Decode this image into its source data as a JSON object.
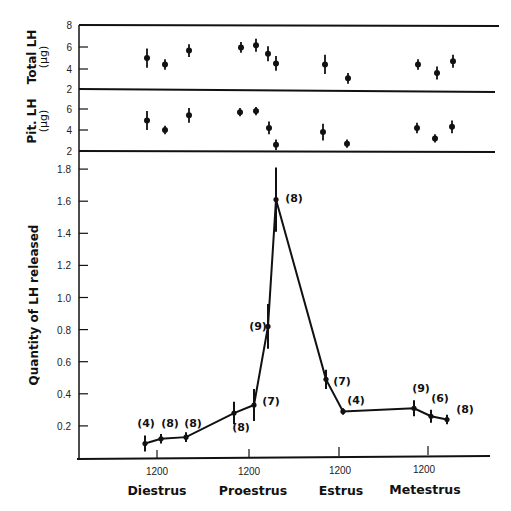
{
  "chart_data": [
    {
      "type": "scatter",
      "panel": "top",
      "ylabel": "Total LH (µg)",
      "ylabel_line1": "Total LH",
      "ylabel_line2": "(µg)",
      "yticks": [
        2,
        4,
        6,
        8
      ],
      "ylim": [
        2,
        8
      ],
      "error_bars": true,
      "points": [
        {
          "x_px": 147,
          "y": 4.9,
          "err": 0.9
        },
        {
          "x_px": 165,
          "y": 4.3,
          "err": 0.5
        },
        {
          "x_px": 189,
          "y": 5.6,
          "err": 0.6
        },
        {
          "x_px": 241,
          "y": 5.9,
          "err": 0.5
        },
        {
          "x_px": 256,
          "y": 6.1,
          "err": 0.6
        },
        {
          "x_px": 268,
          "y": 5.3,
          "err": 0.7
        },
        {
          "x_px": 276,
          "y": 4.4,
          "err": 0.7
        },
        {
          "x_px": 325,
          "y": 4.3,
          "err": 0.9
        },
        {
          "x_px": 348,
          "y": 3.0,
          "err": 0.5
        },
        {
          "x_px": 418,
          "y": 4.3,
          "err": 0.5
        },
        {
          "x_px": 437,
          "y": 3.5,
          "err": 0.6
        },
        {
          "x_px": 453,
          "y": 4.6,
          "err": 0.6
        }
      ]
    },
    {
      "type": "scatter",
      "panel": "middle",
      "ylabel": "Pit. LH (µg)",
      "ylabel_line1": "Pit. LH",
      "ylabel_line2": "(µg)",
      "yticks": [
        2,
        4,
        6
      ],
      "ylim": [
        2,
        7
      ],
      "error_bars": true,
      "points": [
        {
          "x_px": 147,
          "y": 4.9,
          "err": 0.9
        },
        {
          "x_px": 165,
          "y": 4.0,
          "err": 0.4
        },
        {
          "x_px": 189,
          "y": 5.4,
          "err": 0.7
        },
        {
          "x_px": 240,
          "y": 5.7,
          "err": 0.4
        },
        {
          "x_px": 256,
          "y": 5.8,
          "err": 0.4
        },
        {
          "x_px": 269,
          "y": 4.2,
          "err": 0.6
        },
        {
          "x_px": 276,
          "y": 2.6,
          "err": 0.5
        },
        {
          "x_px": 323,
          "y": 3.8,
          "err": 0.8
        },
        {
          "x_px": 347,
          "y": 2.7,
          "err": 0.4
        },
        {
          "x_px": 417,
          "y": 4.2,
          "err": 0.5
        },
        {
          "x_px": 435,
          "y": 3.2,
          "err": 0.4
        },
        {
          "x_px": 452,
          "y": 4.3,
          "err": 0.6
        }
      ]
    },
    {
      "type": "line",
      "panel": "main",
      "title": "",
      "ylabel": "Quantity of LH released",
      "xlabel": "",
      "yticks": [
        0.2,
        0.4,
        0.6,
        0.8,
        1.0,
        1.2,
        1.4,
        1.6,
        1.8
      ],
      "ytick_labels": [
        "0.2",
        "0.4",
        "0.6",
        "0.8",
        "1.0",
        "1.2",
        "1.4",
        "1.6",
        "1.8"
      ],
      "ylim": [
        0,
        2.0
      ],
      "grid": false,
      "x_ticks": [
        {
          "label": "1200",
          "phase": "Diestrus"
        },
        {
          "label": "1200",
          "phase": "Proestrus"
        },
        {
          "label": "1200",
          "phase": "Estrus"
        },
        {
          "label": "1200",
          "phase": "Metestrus"
        }
      ],
      "series": [
        {
          "name": "LH released",
          "points": [
            {
              "x_px": 145,
              "y": 0.09,
              "err": 0.05,
              "n": "(4)"
            },
            {
              "x_px": 161,
              "y": 0.12,
              "err": 0.03,
              "n": "(8)"
            },
            {
              "x_px": 186,
              "y": 0.13,
              "err": 0.03,
              "n": "(8)"
            },
            {
              "x_px": 234,
              "y": 0.28,
              "err": 0.07,
              "n": "(8)"
            },
            {
              "x_px": 254,
              "y": 0.33,
              "err": 0.1,
              "n": "(7)"
            },
            {
              "x_px": 268,
              "y": 0.82,
              "err": 0.14,
              "n": "(9)"
            },
            {
              "x_px": 276,
              "y": 1.61,
              "err": 0.2,
              "n": "(8)"
            },
            {
              "x_px": 326,
              "y": 0.49,
              "err": 0.06,
              "n": "(7)"
            },
            {
              "x_px": 343,
              "y": 0.29,
              "err": 0.02,
              "n": "(4)"
            },
            {
              "x_px": 414,
              "y": 0.31,
              "err": 0.05,
              "n": "(9)"
            },
            {
              "x_px": 431,
              "y": 0.26,
              "err": 0.04,
              "n": "(6)"
            },
            {
              "x_px": 447,
              "y": 0.24,
              "err": 0.03,
              "n": "(8)"
            }
          ]
        }
      ]
    }
  ],
  "labels": {
    "top_ylabel_1": "Total LH",
    "top_ylabel_2": "(µg)",
    "mid_ylabel_1": "Pit. LH",
    "mid_ylabel_2": "(µg)",
    "main_ylabel": "Quantity of LH released",
    "top_ticks": [
      "8",
      "6",
      "4",
      "2"
    ],
    "mid_ticks": [
      "6",
      "4",
      "2"
    ],
    "main_ticks": [
      "1.8",
      "1.6",
      "1.4",
      "1.2",
      "1.0",
      "0.8",
      "0.6",
      "0.4",
      "0.2"
    ],
    "x_ticks": [
      "1200",
      "1200",
      "1200",
      "1200"
    ],
    "phases": [
      "Diestrus",
      "Proestrus",
      "Estrus",
      "Metestrus"
    ],
    "n_labels": [
      "(4)",
      "(8)",
      "(8)",
      "(8)",
      "(7)",
      "(9)",
      "(8)",
      "(7)",
      "(4)",
      "(9)",
      "(6)",
      "(8)"
    ]
  }
}
